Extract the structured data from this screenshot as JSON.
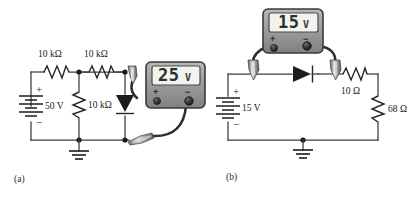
{
  "figure": {
    "panels": [
      {
        "id": "a",
        "caption": "(a)",
        "source": {
          "label": "50 V",
          "plus": "+",
          "minus": "−"
        },
        "components": [
          {
            "name": "resistor-r1",
            "label": "10 kΩ"
          },
          {
            "name": "resistor-r2",
            "label": "10 kΩ"
          },
          {
            "name": "resistor-r3",
            "label": "10 kΩ"
          },
          {
            "name": "diode-d1",
            "label": ""
          }
        ],
        "meter": {
          "reading": "25",
          "unit": "V",
          "plus_terminal": "+",
          "minus_terminal": "−"
        }
      },
      {
        "id": "b",
        "caption": "(b)",
        "source": {
          "label": "15 V",
          "plus": "+",
          "minus": "−"
        },
        "components": [
          {
            "name": "diode-d2",
            "label": ""
          },
          {
            "name": "resistor-r4",
            "label": "10 Ω"
          },
          {
            "name": "resistor-r5",
            "label": "68 Ω"
          }
        ],
        "meter": {
          "reading": "15",
          "unit": "V",
          "plus_terminal": "+",
          "minus_terminal": "−"
        }
      }
    ]
  },
  "colors": {
    "wire": "#3c3c3c",
    "component": "#262626",
    "meter_body": "#9a9a9a",
    "meter_border": "#3a3a3a",
    "lcd": "#f2f2ee",
    "background": "#ffffff"
  }
}
